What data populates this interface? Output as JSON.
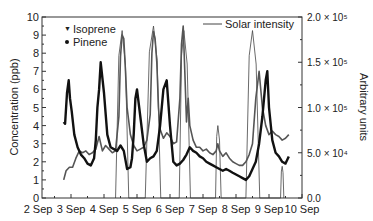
{
  "chart_data": {
    "type": "line",
    "title": "",
    "xlabel": "",
    "ylabel": "Concentration (ppb)",
    "y2label": "Arbitrary units",
    "xlim": [
      "2 Sep",
      "10 Sep"
    ],
    "ylim": [
      0,
      10
    ],
    "y2lim": [
      0,
      200000
    ],
    "grid": false,
    "legend_position": "upper-left (Isoprene, Pinene); upper-right (Solar intensity)",
    "x_tick_labels": [
      "2 Sep",
      "3 Sep",
      "4 Sep",
      "5 Sep",
      "6 Sep",
      "7 Sep",
      "8 Sep",
      "9 Sep",
      "10 Sep"
    ],
    "y_tick_labels": [
      "0",
      "1",
      "2",
      "3",
      "4",
      "5",
      "6",
      "7",
      "8",
      "9",
      "10"
    ],
    "y2_tick_labels": [
      "0.0",
      "5.0 × 10⁴",
      "1.0 × 10⁵",
      "1.5 × 10⁵",
      "2.0 × 10⁵"
    ],
    "series": [
      {
        "name": "Isoprene",
        "axis": "left",
        "marker": "triangle-down",
        "x_days": [
          2.78,
          2.85,
          2.95,
          3.05,
          3.15,
          3.25,
          3.35,
          3.45,
          3.55,
          3.65,
          3.75,
          3.85,
          3.95,
          4.05,
          4.15,
          4.25,
          4.35,
          4.45,
          4.5,
          4.55,
          4.6,
          4.65,
          4.7,
          4.8,
          4.9,
          5.0,
          5.1,
          5.2,
          5.3,
          5.4,
          5.45,
          5.5,
          5.55,
          5.6,
          5.65,
          5.7,
          5.8,
          5.9,
          6.0,
          6.1,
          6.2,
          6.3,
          6.35,
          6.4,
          6.45,
          6.5,
          6.55,
          6.6,
          6.7,
          6.8,
          6.9,
          7.0,
          7.1,
          7.2,
          7.3,
          7.4,
          7.45,
          7.5,
          7.6,
          7.7,
          7.8,
          7.9,
          8.0,
          8.1,
          8.2,
          8.3,
          8.4,
          8.5,
          8.6,
          8.7,
          8.8,
          8.9,
          9.0,
          9.1,
          9.2,
          9.3,
          9.4,
          9.5,
          9.6
        ],
        "values": [
          1.0,
          1.5,
          1.7,
          1.7,
          2.2,
          2.6,
          2.5,
          2.6,
          2.4,
          2.5,
          2.7,
          3.4,
          2.6,
          2.9,
          2.7,
          2.5,
          2.6,
          4.5,
          7.8,
          9.0,
          8.8,
          7.0,
          5.0,
          3.5,
          2.9,
          2.6,
          2.7,
          2.8,
          3.2,
          4.6,
          8.0,
          9.2,
          8.8,
          7.5,
          5.0,
          3.8,
          3.3,
          3.6,
          3.4,
          3.0,
          3.1,
          5.5,
          8.5,
          9.5,
          7.0,
          4.2,
          5.5,
          4.0,
          3.2,
          2.8,
          2.8,
          2.6,
          2.7,
          2.5,
          2.4,
          2.6,
          3.0,
          2.6,
          2.3,
          2.5,
          2.2,
          2.0,
          1.9,
          1.8,
          1.8,
          2.0,
          2.4,
          3.0,
          5.5,
          7.0,
          5.0,
          4.0,
          3.5,
          3.7,
          3.5,
          3.4,
          3.2,
          3.3,
          3.5
        ]
      },
      {
        "name": "Pinene",
        "axis": "left",
        "marker": "circle",
        "x_days": [
          2.78,
          2.82,
          2.88,
          2.93,
          2.97,
          3.02,
          3.1,
          3.2,
          3.3,
          3.4,
          3.5,
          3.6,
          3.7,
          3.75,
          3.8,
          3.85,
          3.9,
          4.0,
          4.1,
          4.2,
          4.3,
          4.4,
          4.5,
          4.6,
          4.7,
          4.8,
          4.85,
          4.9,
          4.95,
          5.0,
          5.1,
          5.2,
          5.3,
          5.4,
          5.5,
          5.6,
          5.7,
          5.8,
          5.9,
          6.0,
          6.1,
          6.2,
          6.3,
          6.4,
          6.5,
          6.6,
          6.7,
          6.8,
          6.9,
          7.0,
          7.1,
          7.2,
          7.3,
          7.4,
          7.5,
          7.6,
          7.7,
          7.8,
          7.9,
          8.0,
          8.1,
          8.2,
          8.3,
          8.4,
          8.5,
          8.6,
          8.7,
          8.8,
          8.9,
          8.95,
          9.0,
          9.1,
          9.2,
          9.3,
          9.4,
          9.5,
          9.6
        ],
        "values": [
          4.2,
          4.1,
          5.8,
          6.5,
          5.5,
          4.8,
          3.5,
          2.8,
          2.4,
          2.2,
          1.9,
          1.8,
          2.2,
          3.2,
          5.0,
          6.0,
          7.5,
          5.8,
          3.5,
          2.8,
          2.7,
          2.6,
          2.9,
          2.6,
          1.6,
          1.7,
          2.2,
          3.5,
          5.5,
          6.0,
          4.5,
          3.0,
          2.0,
          2.2,
          2.3,
          2.6,
          4.0,
          6.0,
          6.5,
          4.0,
          2.0,
          1.8,
          1.9,
          2.1,
          2.4,
          2.8,
          2.6,
          2.5,
          2.3,
          2.2,
          2.0,
          1.9,
          1.8,
          1.7,
          1.6,
          1.5,
          1.6,
          1.5,
          1.4,
          1.3,
          1.2,
          1.1,
          1.0,
          1.2,
          1.6,
          2.0,
          3.0,
          4.5,
          6.5,
          7.0,
          5.0,
          3.2,
          2.5,
          2.3,
          2.0,
          1.9,
          2.3
        ]
      },
      {
        "name": "Solar intensity",
        "axis": "right",
        "note": "daily diurnal peaks (thin line)",
        "peaks": [
          {
            "day_start": 4.35,
            "day_peak": 4.55,
            "day_end": 4.75,
            "value": 185000
          },
          {
            "day_start": 5.25,
            "day_peak": 5.5,
            "day_end": 5.72,
            "value": 190000
          },
          {
            "day_start": 6.28,
            "day_peak": 6.42,
            "day_end": 6.62,
            "value": 185000
          },
          {
            "day_start": 7.38,
            "day_peak": 7.45,
            "day_end": 7.55,
            "value": 80000
          },
          {
            "day_start": 8.3,
            "day_peak": 8.5,
            "day_end": 8.72,
            "value": 185000
          },
          {
            "day_start": 9.35,
            "day_peak": 9.4,
            "day_end": 9.45,
            "value": 35000
          }
        ]
      }
    ]
  },
  "legend": {
    "isoprene_label": "Isoprene",
    "pinene_label": "Pinene",
    "solar_label": "Solar intensity"
  },
  "axes": {
    "y_left_title": "Concentration (ppb)",
    "y_right_title": "Arbitrary units"
  },
  "colors": {
    "isoprene": "#555555",
    "pinene": "#111111",
    "solar": "#444444",
    "axis": "#333333"
  }
}
